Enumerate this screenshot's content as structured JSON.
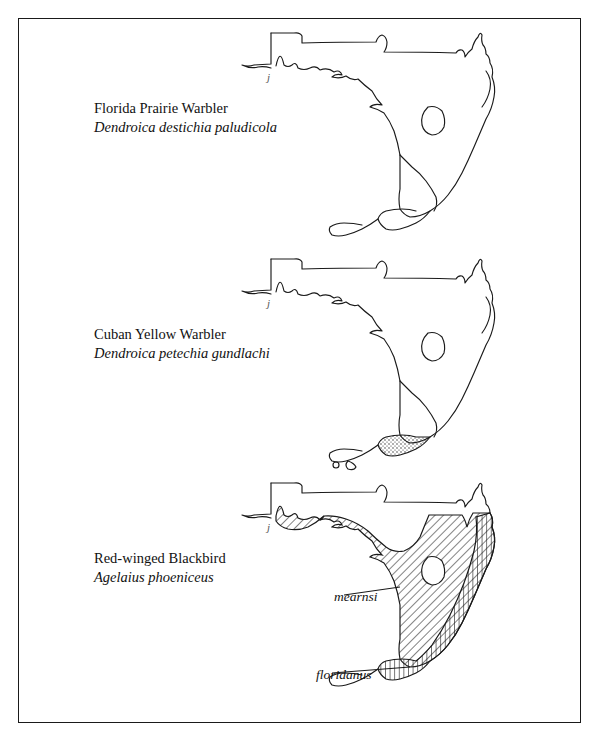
{
  "figure": {
    "frame_color": "#1a1a1a",
    "background": "#ffffff",
    "region": "Florida"
  },
  "panels": [
    {
      "id": "florida-prairie-warbler",
      "common_name": "Florida Prairie Warbler",
      "scientific_name": "Dendroica destichia paludicola",
      "map_fill": "none",
      "annotations": []
    },
    {
      "id": "cuban-yellow-warbler",
      "common_name": "Cuban Yellow Warbler",
      "scientific_name": "Dendroica petechia gundlachi",
      "map_fill": "stipple-south",
      "annotations": []
    },
    {
      "id": "red-winged-blackbird",
      "common_name": "Red-winged Blackbird",
      "scientific_name": "Agelaius phoeniceus",
      "map_fill": "hatched",
      "annotations": [
        {
          "label": "mearnsi",
          "pattern": "diagonal-hatch"
        },
        {
          "label": "floridanus",
          "pattern": "vertical-hatch"
        }
      ]
    }
  ],
  "artifacts": {
    "mark": "j"
  }
}
